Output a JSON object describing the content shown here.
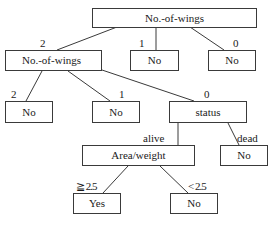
{
  "diagram": {
    "type": "decision-tree",
    "nodes": {
      "root": {
        "label": "No.-of-wings"
      },
      "wings2": {
        "label": "No.-of-wings"
      },
      "wings1_leaf": {
        "label": "No"
      },
      "wings0_leaf": {
        "label": "No"
      },
      "wings2_2_leaf": {
        "label": "No"
      },
      "wings2_1_leaf": {
        "label": "No"
      },
      "status": {
        "label": "status"
      },
      "area_weight": {
        "label": "Area/weight"
      },
      "dead_leaf": {
        "label": "No"
      },
      "ge_leaf": {
        "label": "Yes"
      },
      "lt_leaf": {
        "label": "No"
      }
    },
    "edges": {
      "root_to_wings2": {
        "label": "2"
      },
      "root_to_wings1": {
        "label": "1"
      },
      "root_to_wings0": {
        "label": "0"
      },
      "wings2_to_2": {
        "label": "2"
      },
      "wings2_to_1": {
        "label": "1"
      },
      "wings2_to_status": {
        "label": "0"
      },
      "status_to_alive": {
        "label": "alive"
      },
      "status_to_dead": {
        "label": "dead"
      },
      "area_to_ge": {
        "label": "≧ 2.5"
      },
      "area_to_lt": {
        "label": "< 2.5"
      }
    }
  },
  "colors": {
    "line": "#3a3a3a",
    "text": "#1a1a1a",
    "background": "#ffffff"
  }
}
